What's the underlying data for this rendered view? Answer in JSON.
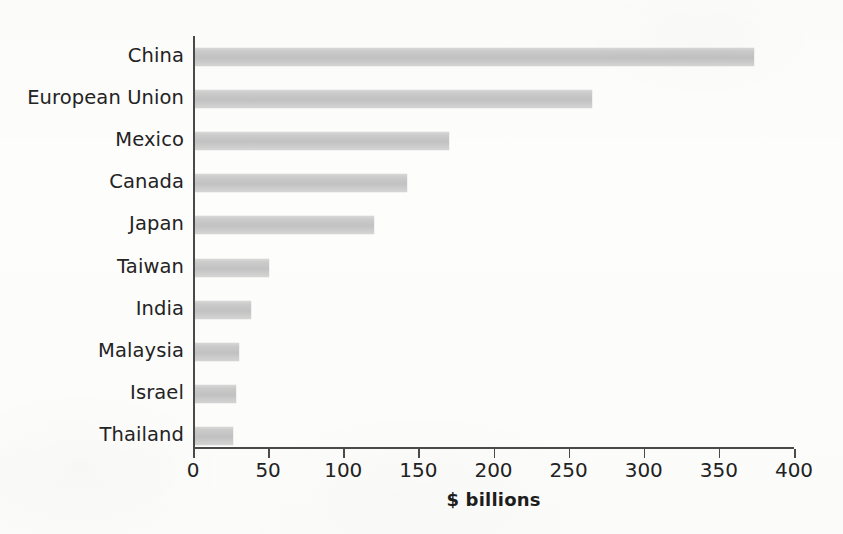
{
  "chart_data": {
    "type": "bar",
    "orientation": "horizontal",
    "title": "",
    "subtitle": "",
    "xlabel": "$ billions",
    "ylabel": "",
    "categories": [
      "China",
      "European Union",
      "Mexico",
      "Canada",
      "Japan",
      "Taiwan",
      "India",
      "Malaysia",
      "Israel",
      "Thailand"
    ],
    "values": [
      372,
      264,
      169,
      141,
      119,
      49,
      37,
      29,
      27,
      25
    ],
    "xlim": [
      0,
      400
    ],
    "xticks": [
      0,
      50,
      100,
      150,
      200,
      250,
      300,
      350,
      400
    ],
    "xtick_labels": [
      "0",
      "50",
      "100",
      "150",
      "200",
      "250",
      "300",
      "350",
      "400"
    ],
    "grid": false,
    "legend": null,
    "legend_position": "none",
    "bar_color": "#c9c9c9",
    "axis_color": "#4a4a4a",
    "background_color": "#fdfdfc",
    "annotations": []
  },
  "bars": [
    {
      "label": "China",
      "value": 372
    },
    {
      "label": "European Union",
      "value": 264
    },
    {
      "label": "Mexico",
      "value": 169
    },
    {
      "label": "Canada",
      "value": 141
    },
    {
      "label": "Japan",
      "value": 119
    },
    {
      "label": "Taiwan",
      "value": 49
    },
    {
      "label": "India",
      "value": 37
    },
    {
      "label": "Malaysia",
      "value": 29
    },
    {
      "label": "Israel",
      "value": 27
    },
    {
      "label": "Thailand",
      "value": 25
    }
  ],
  "axis": {
    "title": "$ billions",
    "ticks": [
      "0",
      "50",
      "100",
      "150",
      "200",
      "250",
      "300",
      "350",
      "400"
    ]
  }
}
